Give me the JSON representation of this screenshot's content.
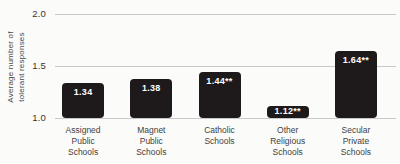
{
  "chart_data": {
    "type": "bar",
    "title": "",
    "ylabel": "Average number of\ntolerant responses",
    "xlabel": "",
    "categories": [
      "Assigned\nPublic\nSchools",
      "Magnet\nPublic\nSchools",
      "Catholic\nSchools",
      "Other\nReligious\nSchools",
      "Secular\nPrivate\nSchools"
    ],
    "values": [
      1.34,
      1.38,
      1.44,
      1.12,
      1.64
    ],
    "value_labels": [
      "1.34",
      "1.38",
      "1.44**",
      "1.12**",
      "1.64**"
    ],
    "ylim": [
      1.0,
      2.0
    ],
    "yticks": [
      2.0,
      1.5,
      1.0
    ],
    "ytick_labels": [
      "2.0",
      "1.5",
      "1.0"
    ],
    "grid": true,
    "legend": null,
    "colors": {
      "bar": "#1e1a1b",
      "grid": "#c9c9c9",
      "value_label": "#ffffff",
      "tick_text": "#333333",
      "category_text": "#3f3f3f",
      "axis_label_text": "#4a4a4a",
      "background": "#fbfbf9"
    }
  }
}
